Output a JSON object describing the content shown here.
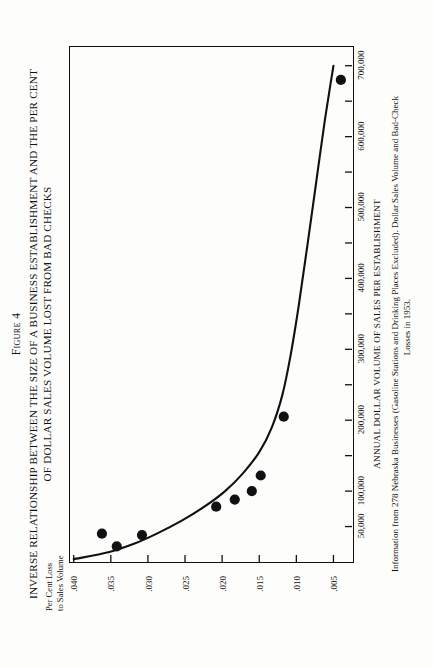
{
  "figure": {
    "number_label": "Figure 4",
    "title_line1": "INVERSE RELATIONSHIP BETWEEN THE SIZE OF A BUSINESS ESTABLISHMENT AND THE PER CENT",
    "title_line2": "OF DOLLAR SALES VOLUME LOST FROM  BAD CHECKS"
  },
  "caption": {
    "line1": "Information from 278 Nebraska Businesses (Gasoline Stations and Drinking Places Excluded). Dollar Sales Volume and Bad-Check",
    "line2": "Losses in 1953."
  },
  "axes": {
    "y_label_line1": "Per Cent Loss",
    "y_label_line2": "to Sales Volume",
    "x_label": "ANNUAL DOLLAR VOLUME OF SALES PER ESTABLISHMENT"
  },
  "chart_data": {
    "type": "scatter",
    "title": "INVERSE RELATIONSHIP BETWEEN THE SIZE OF A BUSINESS ESTABLISHMENT AND THE PER CENT OF DOLLAR SALES VOLUME LOST FROM BAD CHECKS",
    "xlabel": "ANNUAL DOLLAR VOLUME OF SALES PER ESTABLISHMENT",
    "ylabel": "Per Cent Loss to Sales Volume",
    "xlim": [
      0,
      725000
    ],
    "ylim": [
      0.0025,
      0.0405
    ],
    "y_inverted": true,
    "grid": false,
    "legend": null,
    "x_ticks_major": [
      50000,
      100000,
      200000,
      300000,
      400000,
      500000,
      600000,
      700000
    ],
    "x_tick_labels": [
      "50,000",
      "100,000",
      "200,000",
      "300,000",
      "400,000",
      "500,000",
      "600,000",
      "700,000"
    ],
    "x_ticks_minor": [
      50000,
      100000,
      150000,
      200000,
      250000,
      300000,
      350000,
      400000,
      450000,
      500000,
      550000,
      600000,
      650000,
      700000
    ],
    "y_ticks": [
      0.04,
      0.035,
      0.03,
      0.025,
      0.02,
      0.015,
      0.01,
      0.005
    ],
    "y_tick_labels": [
      ".040",
      ".035",
      ".030",
      ".025",
      ".020",
      ".015",
      ".010",
      ".005"
    ],
    "points": [
      {
        "x": 22000,
        "y": 0.0342
      },
      {
        "x": 38000,
        "y": 0.0308
      },
      {
        "x": 40000,
        "y": 0.0362
      },
      {
        "x": 78000,
        "y": 0.0208
      },
      {
        "x": 88000,
        "y": 0.0183
      },
      {
        "x": 100000,
        "y": 0.016
      },
      {
        "x": 122000,
        "y": 0.0148
      },
      {
        "x": 205000,
        "y": 0.0117
      },
      {
        "x": 680000,
        "y": 0.004
      }
    ],
    "fit_curve": {
      "description": "smooth decaying fitted curve",
      "points": [
        {
          "x": 4000,
          "y": 0.04
        },
        {
          "x": 14000,
          "y": 0.0352
        },
        {
          "x": 26000,
          "y": 0.0318
        },
        {
          "x": 40000,
          "y": 0.0288
        },
        {
          "x": 58000,
          "y": 0.0255
        },
        {
          "x": 78000,
          "y": 0.0224
        },
        {
          "x": 100000,
          "y": 0.0196
        },
        {
          "x": 125000,
          "y": 0.0172
        },
        {
          "x": 155000,
          "y": 0.015
        },
        {
          "x": 190000,
          "y": 0.0133
        },
        {
          "x": 235000,
          "y": 0.0119
        },
        {
          "x": 290000,
          "y": 0.0108
        },
        {
          "x": 360000,
          "y": 0.0097
        },
        {
          "x": 440000,
          "y": 0.0086
        },
        {
          "x": 530000,
          "y": 0.0074
        },
        {
          "x": 620000,
          "y": 0.0062
        },
        {
          "x": 700000,
          "y": 0.005
        }
      ]
    }
  },
  "style": {
    "ink": "#111111",
    "paper": "#fdfdfb"
  }
}
